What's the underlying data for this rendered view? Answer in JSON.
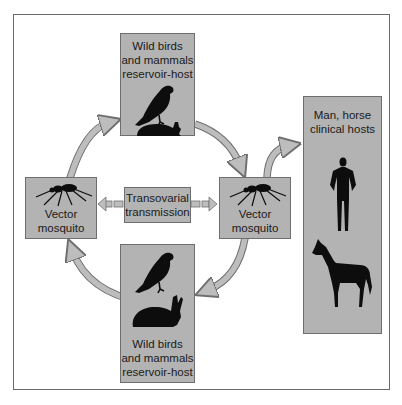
{
  "diagram": {
    "nodes": {
      "reservoir_top": {
        "line1": "Wild birds",
        "line2": "and mammals",
        "line3": "reservoir-host",
        "icons": [
          "bird-icon",
          "rabbit-icon"
        ]
      },
      "vector_left": {
        "line1": "Vector",
        "line2": "mosquito",
        "icons": [
          "mosquito-icon"
        ]
      },
      "transovarial": {
        "line1": "Transovarial",
        "line2": "transmission"
      },
      "vector_right": {
        "line1": "Vector",
        "line2": "mosquito",
        "icons": [
          "mosquito-icon"
        ]
      },
      "reservoir_bottom": {
        "line1": "Wild birds",
        "line2": "and mammals",
        "line3": "reservoir-host",
        "icons": [
          "bird-icon",
          "rabbit-icon"
        ]
      },
      "clinical_hosts": {
        "line1": "Man, horse",
        "line2": "clinical hosts",
        "icons": [
          "human-icon",
          "horse-icon"
        ]
      }
    },
    "edges": [
      {
        "from": "vector_left",
        "to": "reservoir_top",
        "style": "curved-arrow"
      },
      {
        "from": "reservoir_top",
        "to": "vector_right",
        "style": "curved-arrow"
      },
      {
        "from": "vector_right",
        "to": "reservoir_bottom",
        "style": "curved-arrow"
      },
      {
        "from": "reservoir_bottom",
        "to": "vector_left",
        "style": "curved-arrow"
      },
      {
        "from": "vector_right",
        "to": "clinical_hosts",
        "style": "curved-arrow"
      },
      {
        "from": "transovarial",
        "to": "vector_left",
        "style": "dashed-block-arrow"
      },
      {
        "from": "transovarial",
        "to": "vector_right",
        "style": "dashed-block-arrow"
      }
    ],
    "colors": {
      "box_fill": "#b3b3b3",
      "box_border": "#6e6e6e",
      "arrow_fill": "#bdbdbd",
      "arrow_stroke": "#6e6e6e",
      "silhouette": "#0d0d0d",
      "frame": "#6b6b6b"
    }
  }
}
